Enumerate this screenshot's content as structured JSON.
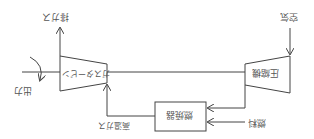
{
  "orientation": "rotated-180",
  "labels": {
    "exhaust": "排ガス",
    "turbine": "ガスタービン",
    "compressor": "圧縮機",
    "air": "空気",
    "combustor": "燃焼器",
    "fuel": "燃料",
    "hot_gas": "高温ガス",
    "output": "出力"
  },
  "colors": {
    "line": "#444444",
    "text": "#555555",
    "background": "#ffffff"
  }
}
